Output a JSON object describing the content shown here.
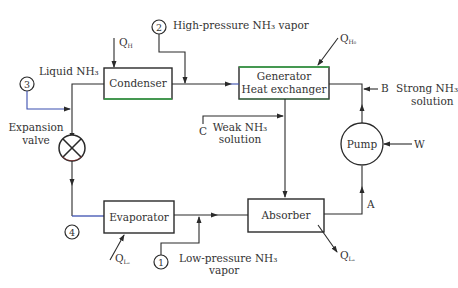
{
  "components": {
    "condenser": "Condenser",
    "generator_line1": "Generator",
    "generator_line2": "Heat exchanger",
    "evaporator": "Evaporator",
    "absorber": "Absorber",
    "pump": "Pump",
    "expansion_valve_line1": "Expansion",
    "expansion_valve_line2": "valve"
  },
  "state_points": [
    "1",
    "2",
    "3",
    "4"
  ],
  "stream_labels": {
    "high_pressure_vapor": "High-pressure NH₃ vapor",
    "liquid_nh3": "Liquid NH₃",
    "low_pressure_line1": "Low-pressure NH₃",
    "low_pressure_line2": "vapor",
    "weak_line1": "Weak NH₃",
    "weak_line2": "solution",
    "strong_line1": "Strong NH₃",
    "strong_line2": "solution"
  },
  "point_labels": {
    "A": "A",
    "B": "B",
    "C": "C"
  },
  "heat_labels": {
    "q_h_main": "Q",
    "q_h_sub": "H",
    "q_hg_main": "Q",
    "q_hg_sub": "H₀",
    "q_le_main": "Q",
    "q_le_sub": "Lₑ",
    "q_la_main": "Q",
    "q_la_sub": "Lₐ",
    "work": "W"
  },
  "colors": {
    "line": "#2a2a2a",
    "text": "#333333",
    "accent_blue": "#3b4fb0",
    "accent_green": "#3aa84a"
  }
}
